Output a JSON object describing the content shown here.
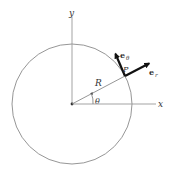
{
  "diagram": {
    "labels": {
      "y_axis": "y",
      "x_axis": "x",
      "radius": "R",
      "point": "P",
      "angle": "θ",
      "e_r_base": "e",
      "e_r_sub": "r",
      "e_theta_base": "e",
      "e_theta_sub": "θ"
    },
    "colors": {
      "line": "#8a8a8a",
      "axis": "#888888",
      "vector": "#111111",
      "text": "#333333"
    }
  }
}
